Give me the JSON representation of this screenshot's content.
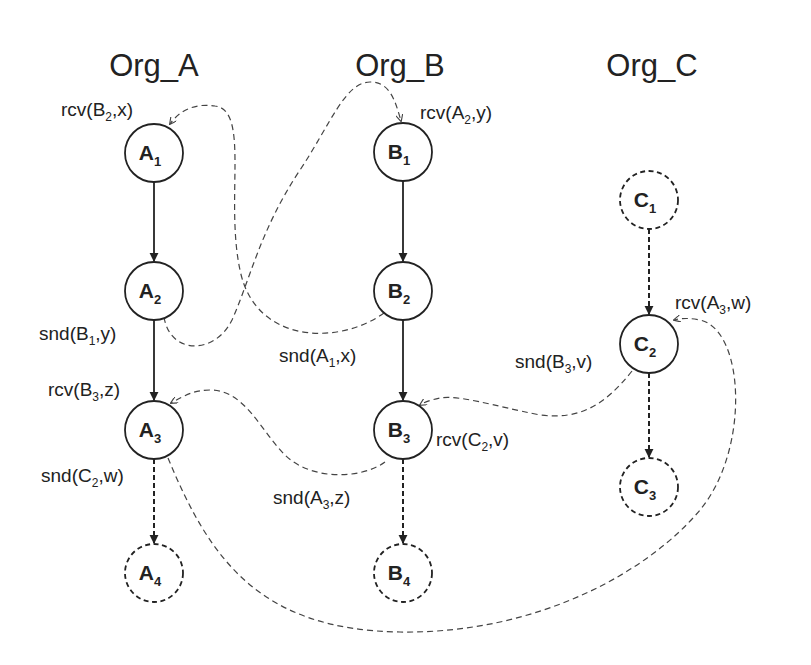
{
  "diagram": {
    "type": "message-sequence / inter-organization process graph",
    "orgs": [
      {
        "id": "Org_A",
        "title": "Org_A"
      },
      {
        "id": "Org_B",
        "title": "Org_B"
      },
      {
        "id": "Org_C",
        "title": "Org_C"
      }
    ],
    "nodes": {
      "A1": {
        "base": "A",
        "sub": "1",
        "style": "solid"
      },
      "A2": {
        "base": "A",
        "sub": "2",
        "style": "solid"
      },
      "A3": {
        "base": "A",
        "sub": "3",
        "style": "solid"
      },
      "A4": {
        "base": "A",
        "sub": "4",
        "style": "dashed"
      },
      "B1": {
        "base": "B",
        "sub": "1",
        "style": "solid"
      },
      "B2": {
        "base": "B",
        "sub": "2",
        "style": "solid"
      },
      "B3": {
        "base": "B",
        "sub": "3",
        "style": "solid"
      },
      "B4": {
        "base": "B",
        "sub": "4",
        "style": "dashed"
      },
      "C1": {
        "base": "C",
        "sub": "1",
        "style": "dashed"
      },
      "C2": {
        "base": "C",
        "sub": "2",
        "style": "solid"
      },
      "C3": {
        "base": "C",
        "sub": "3",
        "style": "dashed"
      }
    },
    "events": {
      "A1_rcv": {
        "pre": "rcv(",
        "base": "B",
        "sub": "2",
        "post": ",x)"
      },
      "A2_snd": {
        "pre": "snd(",
        "base": "B",
        "sub": "1",
        "post": ",y)"
      },
      "A3_rcv": {
        "pre": "rcv(",
        "base": "B",
        "sub": "3",
        "post": ",z)"
      },
      "A3_snd": {
        "pre": "snd(",
        "base": "C",
        "sub": "2",
        "post": ",w)"
      },
      "B1_rcv": {
        "pre": "rcv(",
        "base": "A",
        "sub": "2",
        "post": ",y)"
      },
      "B2_snd": {
        "pre": "snd(",
        "base": "A",
        "sub": "1",
        "post": ",x)"
      },
      "B3_rcv": {
        "pre": "rcv(",
        "base": "C",
        "sub": "2",
        "post": ",v)"
      },
      "B3_snd": {
        "pre": "snd(",
        "base": "A",
        "sub": "3",
        "post": ",z)"
      },
      "C2_rcv": {
        "pre": "rcv(",
        "base": "A",
        "sub": "3",
        "post": ",w)"
      },
      "C2_snd": {
        "pre": "snd(",
        "base": "B",
        "sub": "3",
        "post": ",v)"
      }
    },
    "control_edges": [
      {
        "from": "A1",
        "to": "A2",
        "style": "solid"
      },
      {
        "from": "A2",
        "to": "A3",
        "style": "solid"
      },
      {
        "from": "A3",
        "to": "A4",
        "style": "dashed"
      },
      {
        "from": "B1",
        "to": "B2",
        "style": "solid"
      },
      {
        "from": "B2",
        "to": "B3",
        "style": "solid"
      },
      {
        "from": "B3",
        "to": "B4",
        "style": "dashed"
      },
      {
        "from": "C1",
        "to": "C2",
        "style": "dashed"
      },
      {
        "from": "C2",
        "to": "C3",
        "style": "dashed"
      }
    ],
    "message_edges": [
      {
        "from": "B2",
        "to": "A1",
        "msg": "x"
      },
      {
        "from": "A2",
        "to": "B1",
        "msg": "y"
      },
      {
        "from": "B3",
        "to": "A3",
        "msg": "z"
      },
      {
        "from": "C2",
        "to": "B3",
        "msg": "v"
      },
      {
        "from": "A3",
        "to": "C2",
        "msg": "w"
      }
    ],
    "colors": {
      "ink": "#222222",
      "message_line": "#444444",
      "background": "#ffffff"
    }
  }
}
